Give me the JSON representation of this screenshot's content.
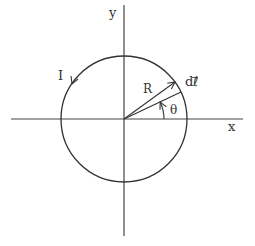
{
  "diagram": {
    "colors": {
      "stroke": "#333333",
      "background": "#ffffff"
    },
    "origin": [
      124,
      119
    ],
    "axes": {
      "x": {
        "label": "x",
        "from": 11,
        "to": 243
      },
      "y": {
        "label": "y",
        "from": 5,
        "to": 236
      }
    },
    "circle": {
      "cx": 124,
      "cy": 119,
      "r": 63,
      "current_label": "I",
      "current_direction": "counterclockwise"
    },
    "radius_vector": {
      "label": "R",
      "angle_deg": 36
    },
    "reference_radius": {
      "angle_deg": 25
    },
    "angle": {
      "label": "θ",
      "arc_radius": 40,
      "from_deg": 0,
      "to_deg": 25
    },
    "element": {
      "label": "dℓ⃗"
    }
  }
}
